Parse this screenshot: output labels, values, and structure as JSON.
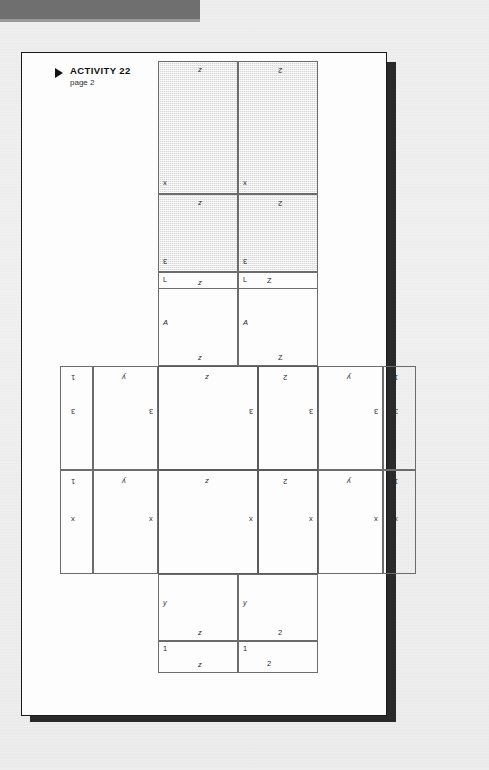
{
  "document": {
    "heading_marker": "triangle-bullet",
    "title": "ACTIVITY 22",
    "subtitle": "page 2"
  },
  "colors": {
    "page": "#fdfdfd",
    "page_border": "#1b1b1b",
    "shadow": "#2a2a2a",
    "header_band": "#6f6f6f",
    "thin_line": "#6c6c6c",
    "thick_line": "#141414",
    "shaded_fill": "#d4d4d4",
    "text": "#2b2b2b"
  },
  "diagram": {
    "name": "box-net-unfolded",
    "top_flap": {
      "shaded": true,
      "cells": [
        {
          "id": "top-upper-left",
          "left_label": "x",
          "bottom_label": "z"
        },
        {
          "id": "top-upper-right",
          "left_label": "x",
          "bottom_label": "2"
        },
        {
          "id": "top-lower-left",
          "left_label": "3",
          "bottom_label": "z"
        },
        {
          "id": "top-lower-right",
          "left_label": "3",
          "bottom_label": "2"
        }
      ]
    },
    "upper_bands": [
      {
        "id": "band-thin-upper",
        "cells": [
          {
            "id": "bt-left",
            "left_label": "L",
            "bottom_label": "z"
          },
          {
            "id": "bt-right",
            "left_label": "L",
            "bottom_label": "Z"
          }
        ]
      },
      {
        "id": "band-tall-upper",
        "cells": [
          {
            "id": "bu-left",
            "left_label": "A",
            "bottom_label": "z"
          },
          {
            "id": "bu-right",
            "left_label": "A",
            "bottom_label": "Z"
          }
        ]
      }
    ],
    "middle_row": {
      "left_wing": [
        {
          "id": "left-narrow",
          "cells": [
            {
              "id": "ln-top",
              "left_label": "3",
              "bottom_label": "1"
            },
            {
              "id": "ln-bottom",
              "left_label": "x",
              "bottom_label": "1"
            }
          ]
        },
        {
          "id": "left-wide",
          "cells": [
            {
              "id": "lw-top",
              "left_label": "3",
              "bottom_label": "y"
            },
            {
              "id": "lw-bottom",
              "left_label": "x",
              "bottom_label": "y"
            }
          ]
        }
      ],
      "center_square": {
        "id": "center-square",
        "emphasis": "thick-border",
        "cells": [
          {
            "id": "cs-top-left",
            "left_label": "3",
            "bottom_label": "z"
          },
          {
            "id": "cs-top-right",
            "left_label": "3",
            "bottom_label": "2"
          },
          {
            "id": "cs-bottom-left",
            "left_label": "x",
            "bottom_label": "z"
          },
          {
            "id": "cs-bottom-right",
            "left_label": "x",
            "bottom_label": "2"
          }
        ]
      },
      "right_wing": [
        {
          "id": "right-wide",
          "cells": [
            {
              "id": "rw-top",
              "left_label": "3",
              "bottom_label": "y"
            },
            {
              "id": "rw-bottom",
              "left_label": "x",
              "bottom_label": "y"
            }
          ]
        },
        {
          "id": "right-narrow",
          "cells": [
            {
              "id": "rn-top",
              "left_label": "3",
              "bottom_label": "1"
            },
            {
              "id": "rn-bottom",
              "left_label": "x",
              "bottom_label": "1"
            }
          ]
        }
      ]
    },
    "lower_bands": [
      {
        "id": "band-tall-lower",
        "cells": [
          {
            "id": "bl-left",
            "left_label": "y",
            "bottom_label": "z"
          },
          {
            "id": "bl-right",
            "left_label": "y",
            "bottom_label": "2"
          }
        ]
      },
      {
        "id": "band-thin-lower",
        "cells": [
          {
            "id": "bn-left",
            "left_label": "1",
            "bottom_label": "z"
          },
          {
            "id": "bn-right",
            "left_label": "1",
            "bottom_label": "2"
          }
        ]
      }
    ]
  }
}
